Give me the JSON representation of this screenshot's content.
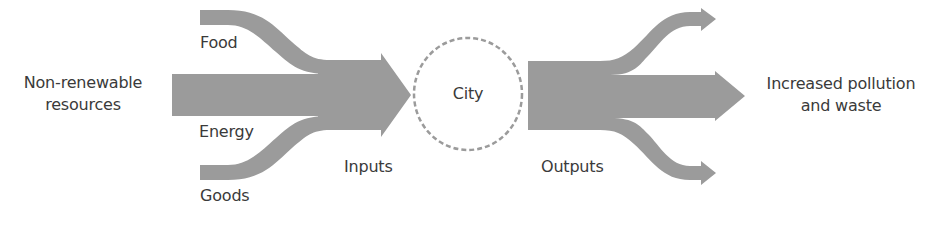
{
  "diagram": {
    "type": "urban metabolism flow diagram",
    "colors": {
      "flow_fill": "#9b9b9b",
      "text": "#3a3a3a",
      "city_outline": "#9b9b9b",
      "background": "#ffffff"
    },
    "source_label": {
      "line1": "Non-renewable",
      "line2": "resources"
    },
    "input_streams": [
      {
        "label": "Food"
      },
      {
        "label": "Energy"
      },
      {
        "label": "Goods"
      }
    ],
    "inputs_label": "Inputs",
    "city_label": "City",
    "outputs_label": "Outputs",
    "output_streams_count": 3,
    "result_label": {
      "line1": "Increased pollution",
      "line2": "and waste"
    }
  }
}
